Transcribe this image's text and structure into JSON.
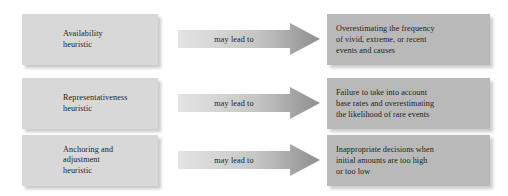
{
  "diagram": {
    "type": "flow-diagram",
    "colors": {
      "left_box_fill": "#d8d8d8",
      "right_box_fill": "#b9b9b9",
      "arrow_fill_start": "#e2e2e2",
      "arrow_fill_end": "#8c8c8c",
      "text": "#231f20",
      "background": "#ffffff"
    },
    "connector_label": "may lead to",
    "rows": [
      {
        "heuristic_lines": [
          "Availability",
          "heuristic"
        ],
        "connector": "may lead to",
        "outcome_lines": [
          "Overestimating the frequency",
          "of vivid, extreme, or recent",
          "events and causes"
        ]
      },
      {
        "heuristic_lines": [
          "Representativeness",
          "heuristic"
        ],
        "connector": "may lead to",
        "outcome_lines": [
          "Failure to take into account",
          "base rates and overestimating",
          "the likelihood of rare events"
        ]
      },
      {
        "heuristic_lines": [
          "Anchoring and",
          "adjustment",
          "heuristic"
        ],
        "connector": "may lead to",
        "outcome_lines": [
          "Inappropriate decisions when",
          "initial amounts are too high",
          "or too low"
        ]
      }
    ]
  }
}
